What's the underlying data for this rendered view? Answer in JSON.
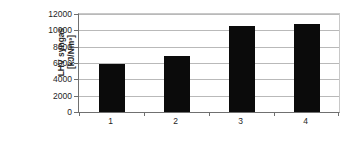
{
  "chart_data": {
    "type": "bar",
    "title": "",
    "subtitle": "",
    "xlabel": "",
    "ylabel": "LHV syngas [kJ/Nm³]",
    "ylabel_line1": "LHV syngas",
    "ylabel_line2": "[kJ/Nm³]",
    "categories": [
      "1",
      "2",
      "3",
      "4"
    ],
    "values": [
      5900,
      6900,
      10500,
      10800
    ],
    "ylim": [
      0,
      12000
    ],
    "ytick_step": 2000,
    "yticks": [
      0,
      2000,
      4000,
      6000,
      8000,
      10000,
      12000
    ],
    "ytick_labels": [
      "0",
      "2000",
      "4000",
      "6000",
      "8000",
      "10000",
      "12000"
    ],
    "grid": true,
    "grid_axis": "y",
    "legend": false,
    "legend_position": "none",
    "bar_color": "#0b0b0b",
    "grid_color": "#b9b9b9",
    "axis_color": "#707070",
    "background_color": "#ffffff"
  }
}
